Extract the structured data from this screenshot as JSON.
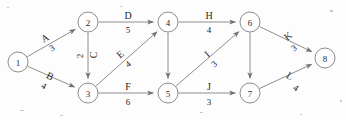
{
  "diagram": {
    "type": "directed-graph",
    "node_colors": {
      "fill": "#ffffff",
      "stroke": "#8c8c8c",
      "text": "#2b2b2b"
    },
    "edge_colors": {
      "stroke": "#8e8e8e",
      "label": "#1f1f1f"
    },
    "nodes": [
      {
        "id": "1",
        "label": "1",
        "x": 18,
        "y": 62
      },
      {
        "id": "2",
        "label": "2",
        "x": 88,
        "y": 22
      },
      {
        "id": "3",
        "label": "3",
        "x": 88,
        "y": 93
      },
      {
        "id": "4",
        "label": "4",
        "x": 168,
        "y": 22
      },
      {
        "id": "5",
        "label": "5",
        "x": 168,
        "y": 93
      },
      {
        "id": "6",
        "label": "6",
        "x": 250,
        "y": 22
      },
      {
        "id": "7",
        "label": "7",
        "x": 250,
        "y": 93
      },
      {
        "id": "8",
        "label": "8",
        "x": 325,
        "y": 58
      }
    ],
    "node_radius": 10,
    "edges": [
      {
        "id": "A",
        "name": "A",
        "weight": "3",
        "from": "1",
        "to": "2",
        "name_x": 45,
        "name_y": 38,
        "weight_x": 52,
        "weight_y": 48,
        "rotate": -30
      },
      {
        "id": "B",
        "name": "B",
        "weight": "4",
        "from": "1",
        "to": "3",
        "name_x": 50,
        "name_y": 76,
        "weight_x": 44,
        "weight_y": 86,
        "rotate": 28
      },
      {
        "id": "C",
        "name": "C",
        "weight": "2",
        "from": "2",
        "to": "3",
        "name_x": 93,
        "name_y": 55,
        "weight_x": 80,
        "weight_y": 56,
        "rotate": -90
      },
      {
        "id": "D",
        "name": "D",
        "weight": "5",
        "from": "2",
        "to": "4",
        "name_x": 128,
        "name_y": 15,
        "weight_x": 128,
        "weight_y": 30,
        "rotate": 0
      },
      {
        "id": "E",
        "name": "E",
        "weight": "4",
        "from": "3",
        "to": "4",
        "name_x": 120,
        "name_y": 54,
        "weight_x": 128,
        "weight_y": 64,
        "rotate": -40
      },
      {
        "id": "F",
        "name": "F",
        "weight": "6",
        "from": "3",
        "to": "5",
        "name_x": 128,
        "name_y": 86,
        "weight_x": 128,
        "weight_y": 102,
        "rotate": 0
      },
      {
        "id": "G",
        "name": "",
        "weight": "",
        "from": "4",
        "to": "5",
        "name_x": 0,
        "name_y": 0,
        "weight_x": 0,
        "weight_y": 0,
        "rotate": 0
      },
      {
        "id": "H",
        "name": "H",
        "weight": "4",
        "from": "4",
        "to": "6",
        "name_x": 209,
        "name_y": 15,
        "weight_x": 209,
        "weight_y": 30,
        "rotate": 0
      },
      {
        "id": "I",
        "name": "I",
        "weight": "3",
        "from": "5",
        "to": "6",
        "name_x": 207,
        "name_y": 54,
        "weight_x": 214,
        "weight_y": 64,
        "rotate": -40
      },
      {
        "id": "J",
        "name": "J",
        "weight": "3",
        "from": "5",
        "to": "7",
        "name_x": 209,
        "name_y": 86,
        "weight_x": 209,
        "weight_y": 102,
        "rotate": 0
      },
      {
        "id": "K",
        "name": "K",
        "weight": "3",
        "from": "6",
        "to": "8",
        "name_x": 288,
        "name_y": 36,
        "weight_x": 294,
        "weight_y": 48,
        "rotate": -38
      },
      {
        "id": "L",
        "name": "L",
        "weight": "4",
        "from": "7",
        "to": "8",
        "name_x": 290,
        "name_y": 76,
        "weight_x": 296,
        "weight_y": 88,
        "rotate": 32
      },
      {
        "id": "M",
        "name": "",
        "weight": "",
        "from": "6",
        "to": "7",
        "name_x": 0,
        "name_y": 0,
        "weight_x": 0,
        "weight_y": 0,
        "rotate": 0
      }
    ]
  }
}
